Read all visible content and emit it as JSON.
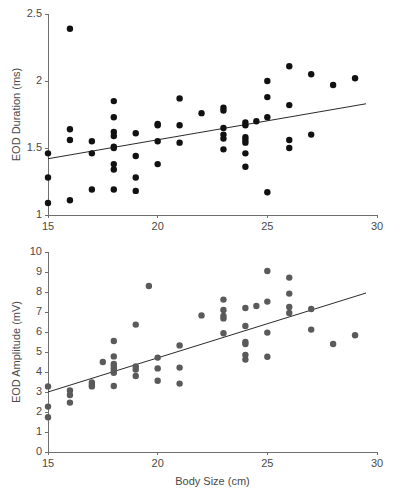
{
  "figure": {
    "name": "eod-vs-body-size-figure",
    "panel_count": 2
  },
  "chart_data": [
    {
      "id": "eod-duration-panel",
      "type": "scatter",
      "title": "",
      "xlabel": "",
      "ylabel": "EOD Duration (ms)",
      "xlim": [
        15,
        30
      ],
      "ylim": [
        1,
        2.5
      ],
      "xticks": [
        15,
        20,
        25,
        30
      ],
      "yticks": [
        1,
        1.5,
        2,
        2.5
      ],
      "xticklabels": [
        "15",
        "20",
        "25",
        "30"
      ],
      "yticklabels": [
        "1",
        "1.5",
        "2",
        "2.5"
      ],
      "grid": false,
      "legend": "none",
      "marker_color": "#111111",
      "marker_size": 3.2,
      "trendline": {
        "x": [
          15,
          29.5
        ],
        "y": [
          1.42,
          1.83
        ],
        "color": "#2a2a2a"
      },
      "points": [
        [
          15,
          1.46
        ],
        [
          15,
          1.28
        ],
        [
          15,
          1.09
        ],
        [
          16,
          2.39
        ],
        [
          16,
          1.64
        ],
        [
          16,
          1.56
        ],
        [
          16,
          1.11
        ],
        [
          17,
          1.55
        ],
        [
          17,
          1.46
        ],
        [
          17,
          1.19
        ],
        [
          18,
          1.85
        ],
        [
          18,
          1.73
        ],
        [
          18,
          1.62
        ],
        [
          18,
          1.59
        ],
        [
          18,
          1.51
        ],
        [
          18,
          1.5
        ],
        [
          18,
          1.38
        ],
        [
          18,
          1.34
        ],
        [
          18,
          1.19
        ],
        [
          19,
          1.61
        ],
        [
          19,
          1.44
        ],
        [
          19,
          1.28
        ],
        [
          19,
          1.18
        ],
        [
          20,
          1.67
        ],
        [
          20,
          1.68
        ],
        [
          20,
          1.55
        ],
        [
          20,
          1.38
        ],
        [
          21,
          1.87
        ],
        [
          21,
          1.67
        ],
        [
          21,
          1.54
        ],
        [
          22,
          1.76
        ],
        [
          23,
          1.8
        ],
        [
          23,
          1.78
        ],
        [
          23,
          1.65
        ],
        [
          23,
          1.6
        ],
        [
          23,
          1.57
        ],
        [
          23,
          1.49
        ],
        [
          24,
          1.69
        ],
        [
          24,
          1.67
        ],
        [
          24,
          1.58
        ],
        [
          24,
          1.56
        ],
        [
          24,
          1.54
        ],
        [
          24,
          1.46
        ],
        [
          24,
          1.36
        ],
        [
          24.5,
          1.7
        ],
        [
          25,
          2.0
        ],
        [
          25,
          1.88
        ],
        [
          25,
          1.73
        ],
        [
          25,
          1.17
        ],
        [
          26,
          2.11
        ],
        [
          26,
          1.82
        ],
        [
          26,
          1.56
        ],
        [
          26,
          1.5
        ],
        [
          27,
          2.05
        ],
        [
          27,
          1.6
        ],
        [
          28,
          1.97
        ],
        [
          29,
          2.02
        ]
      ]
    },
    {
      "id": "eod-amplitude-panel",
      "type": "scatter",
      "title": "",
      "xlabel": "Body Size (cm)",
      "ylabel": "EOD Amplitude (mV)",
      "xlim": [
        15,
        30
      ],
      "ylim": [
        0,
        10
      ],
      "xticks": [
        15,
        20,
        25,
        30
      ],
      "yticks": [
        0,
        1,
        2,
        3,
        4,
        5,
        6,
        7,
        8,
        9,
        10
      ],
      "xticklabels": [
        "15",
        "20",
        "25",
        "30"
      ],
      "yticklabels": [
        "0",
        "1",
        "2",
        "3",
        "4",
        "5",
        "6",
        "7",
        "8",
        "9",
        "10"
      ],
      "grid": false,
      "legend": "none",
      "marker_color": "#5a5a5a",
      "marker_size": 3.2,
      "trendline": {
        "x": [
          15,
          29.5
        ],
        "y": [
          3.0,
          7.95
        ],
        "color": "#2a2a2a"
      },
      "points": [
        [
          15,
          3.28
        ],
        [
          15,
          2.27
        ],
        [
          15,
          1.74
        ],
        [
          16,
          3.08
        ],
        [
          16,
          2.85
        ],
        [
          16,
          2.47
        ],
        [
          17,
          3.48
        ],
        [
          17,
          3.35
        ],
        [
          17,
          3.28
        ],
        [
          17.5,
          4.5
        ],
        [
          18,
          5.55
        ],
        [
          18,
          4.78
        ],
        [
          18,
          4.4
        ],
        [
          18,
          4.3
        ],
        [
          18,
          4.18
        ],
        [
          18,
          4.05
        ],
        [
          18,
          3.96
        ],
        [
          18,
          3.3
        ],
        [
          19,
          6.37
        ],
        [
          19,
          4.28
        ],
        [
          19,
          4.12
        ],
        [
          19,
          3.8
        ],
        [
          19.6,
          8.3
        ],
        [
          20,
          4.72
        ],
        [
          20,
          4.18
        ],
        [
          20,
          3.56
        ],
        [
          21,
          5.33
        ],
        [
          21,
          4.22
        ],
        [
          21,
          3.42
        ],
        [
          22,
          6.83
        ],
        [
          23,
          7.62
        ],
        [
          23,
          7.1
        ],
        [
          23,
          6.8
        ],
        [
          23,
          6.68
        ],
        [
          23,
          5.94
        ],
        [
          24,
          7.2
        ],
        [
          24,
          6.3
        ],
        [
          24,
          5.5
        ],
        [
          24,
          5.4
        ],
        [
          24,
          4.85
        ],
        [
          24,
          4.62
        ],
        [
          24.5,
          7.3
        ],
        [
          25,
          9.05
        ],
        [
          25,
          7.52
        ],
        [
          25,
          5.97
        ],
        [
          25,
          4.76
        ],
        [
          26,
          8.72
        ],
        [
          26,
          7.92
        ],
        [
          26,
          7.25
        ],
        [
          26,
          6.95
        ],
        [
          27,
          7.15
        ],
        [
          27,
          6.12
        ],
        [
          28,
          5.4
        ],
        [
          29,
          5.84
        ]
      ]
    }
  ]
}
